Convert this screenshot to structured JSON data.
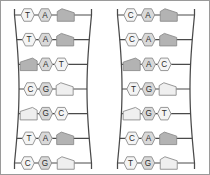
{
  "figure": {
    "ladder_count": 2,
    "rungs_per_ladder": 7
  },
  "colors": {
    "rail": "#4a4a4a",
    "outline": "#8c8c8c",
    "base_light": "#f4f4f4",
    "base_mid": "#d9d9d9",
    "base_dark": "#a8a8a8",
    "shape_light": "#efefef",
    "shape_dark": "#b3b3b3",
    "background": "#ffffff",
    "border": "#9a9a9a",
    "text": "#2b2b2b"
  },
  "ladders": [
    {
      "id": "ladder-left",
      "name": "left-ladder",
      "rungs": [
        {
          "index": 1,
          "cells": [
            {
              "shape": "hexagon",
              "label": "T",
              "tone": "light"
            },
            {
              "shape": "hexagon",
              "label": "A",
              "tone": "mid"
            },
            {
              "shape": "pentagon",
              "label": "",
              "tone": "dark"
            }
          ]
        },
        {
          "index": 2,
          "cells": [
            {
              "shape": "hexagon",
              "label": "T",
              "tone": "light"
            },
            {
              "shape": "hexagon",
              "label": "A",
              "tone": "mid"
            },
            {
              "shape": "pentagon",
              "label": "",
              "tone": "dark"
            }
          ]
        },
        {
          "index": 3,
          "cells": [
            {
              "shape": "pentagon",
              "label": "",
              "tone": "dark"
            },
            {
              "shape": "hexagon",
              "label": "A",
              "tone": "mid"
            },
            {
              "shape": "hexagon",
              "label": "T",
              "tone": "light"
            }
          ]
        },
        {
          "index": 4,
          "cells": [
            {
              "shape": "hexagon",
              "label": "C",
              "tone": "light"
            },
            {
              "shape": "hexagon",
              "label": "G",
              "tone": "mid"
            },
            {
              "shape": "pentagon",
              "label": "",
              "tone": "light"
            }
          ]
        },
        {
          "index": 5,
          "cells": [
            {
              "shape": "pentagon",
              "label": "",
              "tone": "light"
            },
            {
              "shape": "hexagon",
              "label": "G",
              "tone": "mid"
            },
            {
              "shape": "hexagon",
              "label": "C",
              "tone": "light"
            }
          ]
        },
        {
          "index": 6,
          "cells": [
            {
              "shape": "hexagon",
              "label": "T",
              "tone": "light"
            },
            {
              "shape": "hexagon",
              "label": "A",
              "tone": "mid"
            },
            {
              "shape": "pentagon",
              "label": "",
              "tone": "dark"
            }
          ]
        },
        {
          "index": 7,
          "cells": [
            {
              "shape": "hexagon",
              "label": "C",
              "tone": "light"
            },
            {
              "shape": "hexagon",
              "label": "G",
              "tone": "mid"
            },
            {
              "shape": "pentagon",
              "label": "",
              "tone": "light"
            }
          ]
        }
      ]
    },
    {
      "id": "ladder-right",
      "name": "right-ladder",
      "rungs": [
        {
          "index": 1,
          "cells": [
            {
              "shape": "hexagon",
              "label": "C",
              "tone": "light"
            },
            {
              "shape": "hexagon",
              "label": "A",
              "tone": "mid"
            },
            {
              "shape": "pentagon",
              "label": "",
              "tone": "dark"
            }
          ]
        },
        {
          "index": 2,
          "cells": [
            {
              "shape": "hexagon",
              "label": "C",
              "tone": "light"
            },
            {
              "shape": "hexagon",
              "label": "A",
              "tone": "mid"
            },
            {
              "shape": "pentagon",
              "label": "",
              "tone": "dark"
            }
          ]
        },
        {
          "index": 3,
          "cells": [
            {
              "shape": "pentagon",
              "label": "",
              "tone": "dark"
            },
            {
              "shape": "hexagon",
              "label": "A",
              "tone": "mid"
            },
            {
              "shape": "hexagon",
              "label": "C",
              "tone": "light"
            }
          ]
        },
        {
          "index": 4,
          "cells": [
            {
              "shape": "hexagon",
              "label": "T",
              "tone": "light"
            },
            {
              "shape": "hexagon",
              "label": "G",
              "tone": "mid"
            },
            {
              "shape": "pentagon",
              "label": "",
              "tone": "light"
            }
          ]
        },
        {
          "index": 5,
          "cells": [
            {
              "shape": "pentagon",
              "label": "",
              "tone": "light"
            },
            {
              "shape": "hexagon",
              "label": "G",
              "tone": "mid"
            },
            {
              "shape": "hexagon",
              "label": "T",
              "tone": "light"
            }
          ]
        },
        {
          "index": 6,
          "cells": [
            {
              "shape": "hexagon",
              "label": "C",
              "tone": "light"
            },
            {
              "shape": "hexagon",
              "label": "A",
              "tone": "mid"
            },
            {
              "shape": "pentagon",
              "label": "",
              "tone": "dark"
            }
          ]
        },
        {
          "index": 7,
          "cells": [
            {
              "shape": "hexagon",
              "label": "T",
              "tone": "light"
            },
            {
              "shape": "hexagon",
              "label": "G",
              "tone": "mid"
            },
            {
              "shape": "pentagon",
              "label": "",
              "tone": "light"
            }
          ]
        }
      ]
    }
  ]
}
